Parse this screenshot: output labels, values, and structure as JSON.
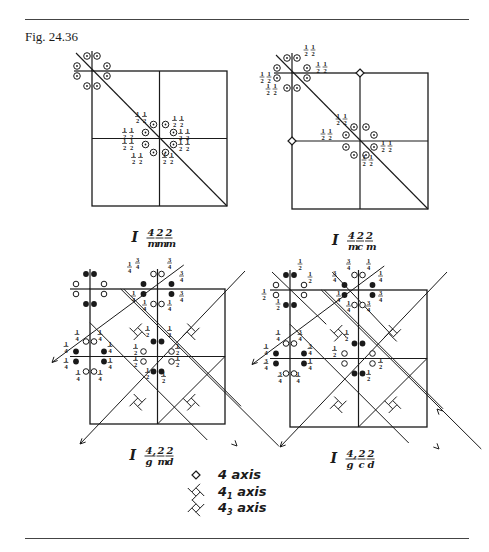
{
  "figure": {
    "label": "Fig. 24.36",
    "panels": [
      {
        "id": "I4/m2/m2/m",
        "caption": {
          "prefix": "I",
          "numerators": [
            "4",
            "2",
            "2"
          ],
          "denominators": [
            "m",
            "m",
            "m"
          ],
          "subscript_comma": false
        },
        "type": "tetragonal-mirror",
        "diagonal_axes": true,
        "four_fold_markers": "center",
        "equipoints": [
          {
            "pos": "corner-tl",
            "symbols": [
              "circle-dot",
              "circle-dot",
              "circle-dot",
              "circle-dot",
              "circle-dot",
              "circle-dot",
              "circle-dot",
              "circle-dot"
            ],
            "heights": []
          },
          {
            "pos": "center",
            "symbols": [
              "circle-dot",
              "circle-dot",
              "circle-dot",
              "circle-dot",
              "circle-dot",
              "circle-dot",
              "circle-dot",
              "circle-dot"
            ],
            "heights": [
              "1/2 1/2",
              "1/2 1/2",
              "1/2 1/2",
              "1/2 1/2",
              "1/2 1/2",
              "1/2 1/2",
              "1/2 1/2",
              "1/2 1/2"
            ]
          }
        ]
      },
      {
        "id": "I4/m2/c2/m",
        "caption": {
          "prefix": "I",
          "numerators": [
            "4",
            "2",
            "2"
          ],
          "denominators": [
            "m",
            "c",
            "m"
          ],
          "subscript_comma": false
        },
        "type": "tetragonal-mirror",
        "diagonal_axes": true,
        "four_fold_markers": "edges",
        "equipoints": [
          {
            "pos": "corner-tl",
            "symbols": [
              "circle-dot",
              "circle-dot",
              "circle-dot",
              "circle-dot",
              "circle-dot",
              "circle-dot",
              "circle-dot",
              "circle-dot"
            ],
            "heights": [
              "1/2 1/2",
              "1/2 1/2",
              "1/2 1/2",
              "1/2 1/2"
            ]
          },
          {
            "pos": "center",
            "symbols": [
              "circle-dot",
              "circle-dot",
              "circle-dot",
              "circle-dot",
              "circle-dot",
              "circle-dot",
              "circle-dot",
              "circle-dot"
            ],
            "heights": [
              "1/2 1/2",
              "1/2 1/2",
              "1/2 1/2",
              "1/2 1/2"
            ]
          }
        ]
      },
      {
        "id": "I4_1/g2/m2/d",
        "caption": {
          "prefix": "I",
          "numerators": [
            "4,",
            "2",
            "2"
          ],
          "denominators": [
            "g",
            "m",
            "d"
          ],
          "subscript_comma": true
        },
        "type": "tetragonal-glide",
        "screw_axes": true,
        "equipoints": [
          {
            "pos": "corner-tl",
            "symbols": [
              "dot",
              "dot",
              "open",
              "open",
              "open",
              "open",
              "dot",
              "dot"
            ],
            "heights": []
          },
          {
            "pos": "top-edge",
            "symbols": [
              "dot",
              "dot",
              "open",
              "open",
              "dot",
              "dot",
              "open",
              "open"
            ],
            "heights": [
              "3/4",
              "3/4",
              "1/4",
              "3/4",
              "3/4",
              "3/4",
              "1/4",
              "1/4"
            ]
          },
          {
            "pos": "left-edge",
            "symbols": [
              "open",
              "open",
              "dot",
              "dot",
              "dot",
              "dot",
              "open",
              "open"
            ],
            "heights": [
              "1/4",
              "1/4",
              "1/4",
              "1/4",
              "1/4",
              "1/4",
              "1/4",
              "1/4"
            ]
          },
          {
            "pos": "center",
            "symbols": [
              "dot",
              "dot",
              "open",
              "open",
              "open",
              "open",
              "dot",
              "dot"
            ],
            "heights": [
              "1/2",
              "1/2",
              "1/2",
              "1/2",
              "1/2",
              "1/2",
              "1/2",
              "1/2"
            ]
          }
        ]
      },
      {
        "id": "I4_1/g2/c2/d",
        "caption": {
          "prefix": "I",
          "numerators": [
            "4,",
            "2",
            "2"
          ],
          "denominators": [
            "g",
            "c",
            "d"
          ],
          "subscript_comma": true
        },
        "type": "tetragonal-glide",
        "screw_axes": true,
        "equipoints": [
          {
            "pos": "corner-tl",
            "symbols": [
              "dot",
              "dot",
              "open",
              "open",
              "open",
              "open",
              "dot",
              "dot"
            ],
            "heights": [
              "1/2",
              "1/2",
              "1/2",
              "1/2"
            ]
          },
          {
            "pos": "top-edge",
            "symbols": [
              "dot",
              "dot",
              "open",
              "open",
              "dot",
              "dot",
              "open",
              "open"
            ],
            "heights": [
              "3/4",
              "3/4",
              "1/4",
              "1/4",
              "3/4",
              "3/4",
              "1/4",
              "1/4"
            ]
          },
          {
            "pos": "left-edge",
            "symbols": [
              "open",
              "open",
              "dot",
              "dot",
              "dot",
              "dot",
              "open",
              "open"
            ],
            "heights": [
              "1/4",
              "3/4",
              "3/4",
              "1/4",
              "3/4",
              "1/4",
              "1/4",
              "3/4"
            ]
          },
          {
            "pos": "center",
            "symbols": [
              "dot",
              "dot",
              "open",
              "open",
              "open",
              "open",
              "dot",
              "dot"
            ],
            "heights": [
              "1/2",
              "1/2",
              "1/2",
              "1/2"
            ]
          }
        ]
      }
    ],
    "legend": [
      {
        "symbol": "four-fold-rotation",
        "label": "4 axis",
        "base": "4",
        "sub": ""
      },
      {
        "symbol": "four-fold-screw-1",
        "label": "41 axis",
        "base": "4",
        "sub": "1"
      },
      {
        "symbol": "four-fold-screw-3",
        "label": "43 axis",
        "base": "4",
        "sub": "3"
      }
    ],
    "legend_suffix": "axis"
  }
}
